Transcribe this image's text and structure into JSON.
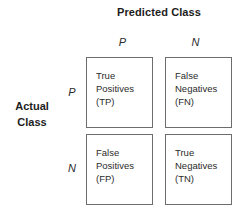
{
  "figure": {
    "type": "confusion-matrix",
    "predicted_axis_title": "Predicted Class",
    "actual_axis_title_line1": "Actual",
    "actual_axis_title_line2": "Class",
    "column_headers": [
      "P",
      "N"
    ],
    "row_headers": [
      "P",
      "N"
    ],
    "colors": {
      "border": "#6d6d6d",
      "title_text": "#1d1d1d",
      "cell_text": "#2b2b2b",
      "background": "#ffffff"
    },
    "cells": [
      {
        "id": "true-positives",
        "row": "P",
        "column": "P",
        "line1": "True",
        "line2": "Positives",
        "line3": "(TP)",
        "abbreviation": "TP"
      },
      {
        "id": "false-negatives",
        "row": "P",
        "column": "N",
        "line1": "False",
        "line2": "Negatives",
        "line3": "(FN)",
        "abbreviation": "FN"
      },
      {
        "id": "false-positives",
        "row": "N",
        "column": "P",
        "line1": "False",
        "line2": "Positives",
        "line3": "(FP)",
        "abbreviation": "FP"
      },
      {
        "id": "true-negatives",
        "row": "N",
        "column": "N",
        "line1": "True",
        "line2": "Negatives",
        "line3": "(TN)",
        "abbreviation": "TN"
      }
    ]
  }
}
